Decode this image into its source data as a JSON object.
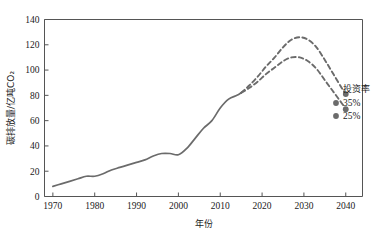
{
  "chart_data": {
    "type": "line",
    "title": "",
    "xlabel": "年份",
    "ylabel": "碳排放量/亿吨CO₂",
    "xlim": [
      1968,
      2044
    ],
    "ylim": [
      0,
      140
    ],
    "ytick_labels": [
      "0",
      "20",
      "40",
      "60",
      "80",
      "100",
      "120",
      "140"
    ],
    "yticks": [
      0,
      20,
      40,
      60,
      80,
      100,
      120,
      140
    ],
    "xtick_labels": [
      "1970",
      "1980",
      "1990",
      "2000",
      "2010",
      "2020",
      "2030",
      "2040"
    ],
    "xticks": [
      1970,
      1980,
      1990,
      2000,
      2010,
      2020,
      2030,
      2040
    ],
    "grid": false,
    "legend_position": "right",
    "legend_title": "投资率",
    "line_color": "#6b6b6b",
    "series": [
      {
        "name": "历史",
        "style": "solid",
        "marker": "none",
        "x": [
          1970,
          1972,
          1974,
          1976,
          1978,
          1980,
          1982,
          1984,
          1986,
          1988,
          1990,
          1992,
          1994,
          1996,
          1998,
          2000,
          2002,
          2004,
          2006,
          2008,
          2010,
          2012,
          2014,
          2015
        ],
        "values": [
          8,
          10,
          12,
          14,
          16,
          16,
          18,
          21,
          23,
          25,
          27,
          29,
          32,
          34,
          34,
          33,
          38,
          46,
          54,
          60,
          70,
          77,
          80,
          82
        ]
      },
      {
        "name": "35%",
        "style": "dashed",
        "marker": "circle",
        "x": [
          2015,
          2017,
          2019,
          2021,
          2023,
          2025,
          2027,
          2029,
          2031,
          2033,
          2035,
          2037,
          2039,
          2040
        ],
        "values": [
          82,
          88,
          95,
          103,
          110,
          118,
          124,
          126,
          124,
          118,
          108,
          97,
          86,
          81
        ]
      },
      {
        "name": "25%",
        "style": "dashed",
        "marker": "circle",
        "x": [
          2015,
          2017,
          2019,
          2021,
          2023,
          2025,
          2027,
          2029,
          2031,
          2033,
          2035,
          2037,
          2039,
          2040
        ],
        "values": [
          82,
          86,
          91,
          97,
          102,
          107,
          110,
          110,
          107,
          101,
          92,
          83,
          74,
          69
        ]
      }
    ],
    "legend_entries": [
      {
        "label": "35%",
        "marker": "circle",
        "color": "#6b6b6b"
      },
      {
        "label": "25%",
        "marker": "circle",
        "color": "#6b6b6b"
      }
    ]
  }
}
